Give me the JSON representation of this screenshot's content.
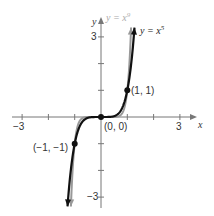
{
  "chart_data": {
    "type": "line",
    "title": "",
    "xlabel": "x",
    "ylabel": "y",
    "xlim": [
      -3,
      3
    ],
    "ylim": [
      -3,
      3
    ],
    "x_ticks": [
      -3,
      -2,
      -1,
      0,
      1,
      2,
      3
    ],
    "y_ticks": [
      -3,
      -2,
      -1,
      0,
      1,
      2,
      3
    ],
    "x_tick_labels_shown": [
      "-3",
      "3"
    ],
    "y_tick_labels_shown": [
      "3",
      "-3"
    ],
    "grid": false,
    "series": [
      {
        "name": "y = x^9",
        "color": "#999999",
        "function": "x^9"
      },
      {
        "name": "y = x^5",
        "color": "#111111",
        "function": "x^5"
      }
    ],
    "points": [
      {
        "label": "(-1, -1)",
        "x": -1,
        "y": -1
      },
      {
        "label": "(0, 0)",
        "x": 0,
        "y": 0
      },
      {
        "label": "(1, 1)",
        "x": 1,
        "y": 1
      }
    ]
  },
  "labels": {
    "x_axis": "x",
    "y_axis": "y",
    "x_neg3": "−3",
    "x_pos3": "3",
    "y_pos3": "3",
    "y_neg3": "−3",
    "series_x9_prefix": "y = x",
    "series_x9_exp": "9",
    "series_x5_prefix": "y = x",
    "series_x5_exp": "5",
    "pt_neg": "(−1, −1)",
    "pt_origin": "(0, 0)",
    "pt_pos": "(1, 1)"
  }
}
